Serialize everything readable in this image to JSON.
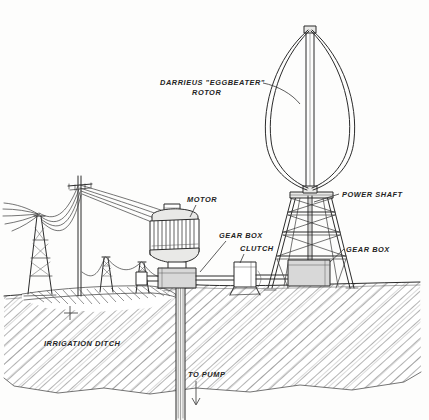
{
  "illustration": {
    "title": "Darrieus eggbeater rotor wind turbine driving an irrigation pump",
    "style": "hand-drawn pen and ink technical illustration",
    "background_color": "#fdfdfc",
    "ink_color": "#2b2b2b",
    "shade_color": "#d8d8d8"
  },
  "labels": {
    "rotor_line1": "DARRIEUS \"EGGBEATER\"",
    "rotor_line2": "ROTOR",
    "motor": "MOTOR",
    "gear_box_motor": "GEAR BOX",
    "clutch": "CLUTCH",
    "power_shaft": "POWER SHAFT",
    "gear_box_tower": "GEAR BOX",
    "irrigation_ditch": "IRRIGATION DITCH",
    "to_pump": "TO PUMP"
  },
  "components": [
    {
      "name": "darrieus-rotor",
      "label": "DARRIEUS \"EGGBEATER\" ROTOR",
      "blades": 2
    },
    {
      "name": "power-shaft",
      "label": "POWER SHAFT"
    },
    {
      "name": "lattice-tower",
      "label": ""
    },
    {
      "name": "tower-gear-box",
      "label": "GEAR BOX"
    },
    {
      "name": "clutch",
      "label": "CLUTCH"
    },
    {
      "name": "motor",
      "label": "MOTOR"
    },
    {
      "name": "motor-gear-box",
      "label": "GEAR BOX"
    },
    {
      "name": "well-casing",
      "label": "TO PUMP"
    },
    {
      "name": "irrigation-ditch",
      "label": "IRRIGATION DITCH"
    },
    {
      "name": "transmission-lines",
      "label": ""
    }
  ]
}
